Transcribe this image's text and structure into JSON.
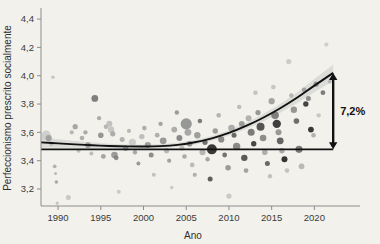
{
  "chart_data": {
    "type": "scatter",
    "title": "",
    "xlabel": "Ano",
    "ylabel": "Perfeccionismo prescrito socialmente",
    "xlim": [
      1988,
      2023
    ],
    "ylim": [
      3.08,
      4.45
    ],
    "grid": false,
    "legend": "none",
    "xticks": [
      1990,
      1995,
      2000,
      2005,
      2010,
      2015,
      2020
    ],
    "xtick_labels": [
      "1990",
      "1995",
      "2000",
      "2005",
      "2010",
      "2015",
      "2020"
    ],
    "yticks": [
      3.2,
      3.4,
      3.6,
      3.8,
      4.0,
      4.2,
      4.4
    ],
    "ytick_labels": [
      "3,2",
      "3,4",
      "3,6",
      "3,8",
      "4,0",
      "4,2",
      "4,4"
    ],
    "annotations": [
      {
        "name": "increase-bracket",
        "label": "7,2%",
        "type": "double-arrow-vertical",
        "from_value": 3.48,
        "to_value": 4.02,
        "at_year": 2022.2
      }
    ],
    "reference_line": {
      "name": "baseline",
      "y": 3.48,
      "from_year": 1988,
      "to_year": 2022.2,
      "color": "#111111"
    },
    "trend_line": {
      "name": "quadratic-fit",
      "color": "#111111",
      "band_color": "#c9c9c9",
      "points": [
        {
          "x": 1988.0,
          "y": 3.529
        },
        {
          "x": 1990.0,
          "y": 3.522
        },
        {
          "x": 1992.0,
          "y": 3.515
        },
        {
          "x": 1994.0,
          "y": 3.509
        },
        {
          "x": 1996.0,
          "y": 3.504
        },
        {
          "x": 1998.0,
          "y": 3.501
        },
        {
          "x": 2000.0,
          "y": 3.5
        },
        {
          "x": 2002.0,
          "y": 3.503
        },
        {
          "x": 2004.0,
          "y": 3.512
        },
        {
          "x": 2006.0,
          "y": 3.53
        },
        {
          "x": 2008.0,
          "y": 3.558
        },
        {
          "x": 2010.0,
          "y": 3.596
        },
        {
          "x": 2012.0,
          "y": 3.645
        },
        {
          "x": 2014.0,
          "y": 3.703
        },
        {
          "x": 2016.0,
          "y": 3.77
        },
        {
          "x": 2018.0,
          "y": 3.846
        },
        {
          "x": 2020.0,
          "y": 3.93
        },
        {
          "x": 2022.2,
          "y": 4.02
        }
      ],
      "band_halfwidth": [
        0.038,
        0.03,
        0.024,
        0.019,
        0.016,
        0.014,
        0.013,
        0.013,
        0.014,
        0.015,
        0.017,
        0.019,
        0.022,
        0.026,
        0.031,
        0.038,
        0.047,
        0.058
      ]
    },
    "points": [
      {
        "x": 1988.6,
        "y": 3.58,
        "r": 4.6,
        "c": "#c9c9c9"
      },
      {
        "x": 1988.9,
        "y": 3.56,
        "r": 3.1,
        "c": "#9a9a9a"
      },
      {
        "x": 1989.2,
        "y": 3.52,
        "r": 2.2,
        "c": "#b4b4b4"
      },
      {
        "x": 1989.4,
        "y": 3.99,
        "r": 1.7,
        "c": "#bdbdbd"
      },
      {
        "x": 1989.6,
        "y": 3.36,
        "r": 1.9,
        "c": "#a8a8a8"
      },
      {
        "x": 1989.7,
        "y": 3.31,
        "r": 1.5,
        "c": "#b0b0b0"
      },
      {
        "x": 1989.8,
        "y": 3.25,
        "r": 1.8,
        "c": "#9e9e9e"
      },
      {
        "x": 1989.9,
        "y": 3.1,
        "r": 1.6,
        "c": "#bfbfbf"
      },
      {
        "x": 1991.2,
        "y": 3.14,
        "r": 2.5,
        "c": "#c2c2c2"
      },
      {
        "x": 1991.6,
        "y": 3.6,
        "r": 2.1,
        "c": "#aeaeae"
      },
      {
        "x": 1992.0,
        "y": 3.64,
        "r": 2.6,
        "c": "#9b9b9b"
      },
      {
        "x": 1992.4,
        "y": 3.47,
        "r": 2.0,
        "c": "#b8b8b8"
      },
      {
        "x": 1992.8,
        "y": 3.56,
        "r": 2.3,
        "c": "#a5a5a5"
      },
      {
        "x": 1993.2,
        "y": 3.6,
        "r": 2.2,
        "c": "#9f9f9f"
      },
      {
        "x": 1993.5,
        "y": 3.51,
        "r": 2.9,
        "c": "#8c8c8c"
      },
      {
        "x": 1993.9,
        "y": 3.45,
        "r": 2.0,
        "c": "#b5b5b5"
      },
      {
        "x": 1994.3,
        "y": 3.84,
        "r": 3.4,
        "c": "#6e6e6e"
      },
      {
        "x": 1994.8,
        "y": 3.7,
        "r": 2.1,
        "c": "#a0a0a0"
      },
      {
        "x": 1995.0,
        "y": 3.58,
        "r": 2.8,
        "c": "#8a8a8a"
      },
      {
        "x": 1995.3,
        "y": 3.43,
        "r": 2.4,
        "c": "#989898"
      },
      {
        "x": 1995.6,
        "y": 3.64,
        "r": 2.2,
        "c": "#acacac"
      },
      {
        "x": 1996.0,
        "y": 3.66,
        "r": 3.0,
        "c": "#b9b9b9"
      },
      {
        "x": 1996.2,
        "y": 3.62,
        "r": 3.2,
        "c": "#c0c0c0"
      },
      {
        "x": 1996.4,
        "y": 3.59,
        "r": 2.6,
        "c": "#a2a2a2"
      },
      {
        "x": 1996.6,
        "y": 3.44,
        "r": 3.3,
        "c": "#8e8e8e"
      },
      {
        "x": 1996.8,
        "y": 3.42,
        "r": 2.4,
        "c": "#7d7d7d"
      },
      {
        "x": 1997.1,
        "y": 3.18,
        "r": 2.0,
        "c": "#c4c4c4"
      },
      {
        "x": 1997.5,
        "y": 3.55,
        "r": 2.5,
        "c": "#a9a9a9"
      },
      {
        "x": 1997.9,
        "y": 3.49,
        "r": 2.8,
        "c": "#949494"
      },
      {
        "x": 1998.3,
        "y": 3.61,
        "r": 2.1,
        "c": "#b2b2b2"
      },
      {
        "x": 1998.7,
        "y": 3.53,
        "r": 3.6,
        "c": "#c6c6c6"
      },
      {
        "x": 1999.0,
        "y": 3.46,
        "r": 2.2,
        "c": "#9d9d9d"
      },
      {
        "x": 1999.4,
        "y": 3.38,
        "r": 2.0,
        "c": "#8b8b8b"
      },
      {
        "x": 1999.8,
        "y": 3.57,
        "r": 2.7,
        "c": "#b6b6b6"
      },
      {
        "x": 2000.1,
        "y": 3.63,
        "r": 2.3,
        "c": "#a4a4a4"
      },
      {
        "x": 2000.5,
        "y": 3.51,
        "r": 3.1,
        "c": "#919191"
      },
      {
        "x": 2000.9,
        "y": 3.44,
        "r": 2.5,
        "c": "#7f7f7f"
      },
      {
        "x": 2001.2,
        "y": 3.3,
        "r": 2.0,
        "c": "#bbbbbb"
      },
      {
        "x": 2001.6,
        "y": 3.58,
        "r": 2.4,
        "c": "#a6a6a6"
      },
      {
        "x": 2002.0,
        "y": 3.66,
        "r": 2.2,
        "c": "#999999"
      },
      {
        "x": 2002.3,
        "y": 3.54,
        "r": 3.4,
        "c": "#8d8d8d"
      },
      {
        "x": 2002.7,
        "y": 3.47,
        "r": 2.6,
        "c": "#b1b1b1"
      },
      {
        "x": 2003.0,
        "y": 3.4,
        "r": 2.1,
        "c": "#969696"
      },
      {
        "x": 2003.3,
        "y": 3.21,
        "r": 1.8,
        "c": "#c5c5c5"
      },
      {
        "x": 2003.6,
        "y": 3.62,
        "r": 2.9,
        "c": "#a3a3a3"
      },
      {
        "x": 2003.9,
        "y": 3.74,
        "r": 2.2,
        "c": "#8f8f8f"
      },
      {
        "x": 2004.2,
        "y": 3.56,
        "r": 3.0,
        "c": "#7a7a7a"
      },
      {
        "x": 2004.5,
        "y": 3.49,
        "r": 2.5,
        "c": "#b7b7b7"
      },
      {
        "x": 2004.8,
        "y": 3.43,
        "r": 2.3,
        "c": "#a1a1a1"
      },
      {
        "x": 2005.0,
        "y": 3.66,
        "r": 5.6,
        "c": "#8a8a8a"
      },
      {
        "x": 2005.2,
        "y": 3.6,
        "r": 3.4,
        "c": "#9c9c9c"
      },
      {
        "x": 2005.4,
        "y": 3.52,
        "r": 2.8,
        "c": "#858585"
      },
      {
        "x": 2005.7,
        "y": 3.37,
        "r": 2.4,
        "c": "#b3b3b3"
      },
      {
        "x": 2006.0,
        "y": 3.3,
        "r": 2.1,
        "c": "#a7a7a7"
      },
      {
        "x": 2006.3,
        "y": 3.58,
        "r": 3.2,
        "c": "#929292"
      },
      {
        "x": 2006.6,
        "y": 3.68,
        "r": 2.3,
        "c": "#6c6c6c"
      },
      {
        "x": 2006.9,
        "y": 3.46,
        "r": 3.0,
        "c": "#adadad"
      },
      {
        "x": 2007.2,
        "y": 3.53,
        "r": 2.6,
        "c": "#606060"
      },
      {
        "x": 2007.5,
        "y": 3.41,
        "r": 2.2,
        "c": "#9a9a9a"
      },
      {
        "x": 2007.8,
        "y": 3.27,
        "r": 2.5,
        "c": "#4a4a4a"
      },
      {
        "x": 2008.0,
        "y": 3.48,
        "r": 5.0,
        "c": "#1e1e1e"
      },
      {
        "x": 2008.4,
        "y": 3.61,
        "r": 2.7,
        "c": "#909090"
      },
      {
        "x": 2008.8,
        "y": 3.72,
        "r": 2.3,
        "c": "#ababab"
      },
      {
        "x": 2009.1,
        "y": 3.55,
        "r": 3.1,
        "c": "#7c7c7c"
      },
      {
        "x": 2009.5,
        "y": 3.44,
        "r": 2.4,
        "c": "#636363"
      },
      {
        "x": 2009.9,
        "y": 3.35,
        "r": 2.8,
        "c": "#8f8f8f"
      },
      {
        "x": 2010.0,
        "y": 3.15,
        "r": 2.6,
        "c": "#c3c3c3"
      },
      {
        "x": 2010.3,
        "y": 3.63,
        "r": 3.3,
        "c": "#a0a0a0"
      },
      {
        "x": 2010.6,
        "y": 3.58,
        "r": 2.5,
        "c": "#555555"
      },
      {
        "x": 2010.9,
        "y": 3.5,
        "r": 3.7,
        "c": "#7b7b7b"
      },
      {
        "x": 2011.2,
        "y": 3.78,
        "r": 2.2,
        "c": "#b5b5b5"
      },
      {
        "x": 2011.5,
        "y": 3.66,
        "r": 2.9,
        "c": "#8e8e8e"
      },
      {
        "x": 2011.8,
        "y": 3.42,
        "r": 3.2,
        "c": "#444444"
      },
      {
        "x": 2012.0,
        "y": 3.33,
        "r": 2.4,
        "c": "#999999"
      },
      {
        "x": 2012.3,
        "y": 3.7,
        "r": 3.0,
        "c": "#a8a8a8"
      },
      {
        "x": 2012.6,
        "y": 3.6,
        "r": 3.5,
        "c": "#6a6a6a"
      },
      {
        "x": 2012.9,
        "y": 3.52,
        "r": 2.7,
        "c": "#2f2f2f"
      },
      {
        "x": 2013.1,
        "y": 3.88,
        "r": 2.3,
        "c": "#bcbcbc"
      },
      {
        "x": 2013.4,
        "y": 3.74,
        "r": 2.6,
        "c": "#8b8b8b"
      },
      {
        "x": 2013.7,
        "y": 3.64,
        "r": 4.0,
        "c": "#3d3d3d"
      },
      {
        "x": 2014.0,
        "y": 3.56,
        "r": 3.3,
        "c": "#7e7e7e"
      },
      {
        "x": 2014.2,
        "y": 3.46,
        "r": 2.8,
        "c": "#a5a5a5"
      },
      {
        "x": 2014.5,
        "y": 3.38,
        "r": 2.5,
        "c": "#555555"
      },
      {
        "x": 2014.8,
        "y": 3.29,
        "r": 2.2,
        "c": "#b9b9b9"
      },
      {
        "x": 2015.0,
        "y": 3.82,
        "r": 3.1,
        "c": "#999999"
      },
      {
        "x": 2015.2,
        "y": 3.92,
        "r": 2.4,
        "c": "#c0c0c0"
      },
      {
        "x": 2015.4,
        "y": 3.72,
        "r": 3.8,
        "c": "#6f6f6f"
      },
      {
        "x": 2015.6,
        "y": 3.66,
        "r": 4.2,
        "c": "#262626"
      },
      {
        "x": 2015.8,
        "y": 3.6,
        "r": 3.0,
        "c": "#8c8c8c"
      },
      {
        "x": 2016.0,
        "y": 3.54,
        "r": 3.4,
        "c": "#505050"
      },
      {
        "x": 2016.2,
        "y": 3.47,
        "r": 2.7,
        "c": "#a2a2a2"
      },
      {
        "x": 2016.5,
        "y": 3.41,
        "r": 3.0,
        "c": "#1a1a1a"
      },
      {
        "x": 2016.8,
        "y": 3.33,
        "r": 2.3,
        "c": "#bdbdbd"
      },
      {
        "x": 2017.0,
        "y": 4.1,
        "r": 2.6,
        "c": "#c6c6c6"
      },
      {
        "x": 2017.3,
        "y": 3.86,
        "r": 2.2,
        "c": "#adadad"
      },
      {
        "x": 2017.6,
        "y": 3.76,
        "r": 3.2,
        "c": "#8a8a8a"
      },
      {
        "x": 2017.9,
        "y": 3.68,
        "r": 2.8,
        "c": "#5b5b5b"
      },
      {
        "x": 2018.2,
        "y": 3.48,
        "r": 3.6,
        "c": "#676767"
      },
      {
        "x": 2018.5,
        "y": 3.36,
        "r": 2.9,
        "c": "#b0b0b0"
      },
      {
        "x": 2018.8,
        "y": 3.9,
        "r": 2.4,
        "c": "#9b9b9b"
      },
      {
        "x": 2019.0,
        "y": 3.8,
        "r": 2.7,
        "c": "#2b2b2b"
      },
      {
        "x": 2019.3,
        "y": 3.84,
        "r": 2.5,
        "c": "#7d7d7d"
      },
      {
        "x": 2019.6,
        "y": 3.62,
        "r": 2.9,
        "c": "#1f1f1f"
      },
      {
        "x": 2019.9,
        "y": 3.58,
        "r": 2.3,
        "c": "#a9a9a9"
      },
      {
        "x": 2020.2,
        "y": 3.94,
        "r": 2.6,
        "c": "#888888"
      },
      {
        "x": 2020.5,
        "y": 3.72,
        "r": 2.2,
        "c": "#c2c2c2"
      },
      {
        "x": 2021.0,
        "y": 3.88,
        "r": 2.4,
        "c": "#6d6d6d"
      },
      {
        "x": 2021.4,
        "y": 4.22,
        "r": 2.1,
        "c": "#cacaca"
      },
      {
        "x": 2021.8,
        "y": 3.96,
        "r": 2.0,
        "c": "#b4b4b4"
      }
    ]
  }
}
